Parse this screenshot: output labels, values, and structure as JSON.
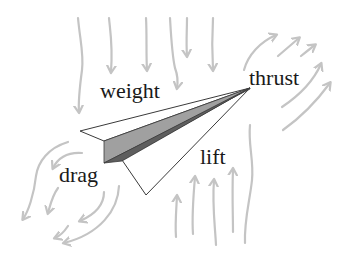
{
  "diagram": {
    "labels": {
      "weight": "weight",
      "thrust": "thrust",
      "drag": "drag",
      "lift": "lift"
    },
    "colors": {
      "background": "#ffffff",
      "flow_arrows": "#c4c4c4",
      "plane_outline": "#3a3a3a",
      "plane_wing": "#ffffff",
      "plane_keel_light": "#a0a0a0",
      "plane_keel_dark": "#5e5e5e",
      "text": "#1a1a1a"
    },
    "arrow_groups": [
      {
        "name": "weight-arrows",
        "direction": "down",
        "count": 6
      },
      {
        "name": "thrust-arrows",
        "direction": "up-right",
        "count": 5
      },
      {
        "name": "drag-arrows",
        "direction": "down-left curved",
        "count": 6
      },
      {
        "name": "lift-arrows",
        "direction": "up",
        "count": 5
      }
    ]
  }
}
